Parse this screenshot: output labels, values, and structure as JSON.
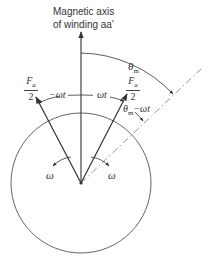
{
  "diagram": {
    "axis_label": {
      "line1": "Magnetic axis",
      "line2": "of winding aa'"
    },
    "theta_m_label": {
      "base": "θ",
      "sub": "m"
    },
    "theta_minus_label": {
      "base": "θ",
      "sub": "m",
      "rest": "−ωt"
    },
    "left_vector_label": {
      "num": "F",
      "num_sub": "a",
      "den": "2"
    },
    "right_vector_label": {
      "num": "F",
      "num_sub": "a",
      "den": "2"
    },
    "left_angle_label": "−ωt",
    "right_angle_label": "ωt",
    "left_rotation_label": "ω",
    "right_rotation_label": "ω",
    "colors": {
      "stroke": "#333333",
      "dashdot": "#888888",
      "background": "#ffffff"
    }
  }
}
